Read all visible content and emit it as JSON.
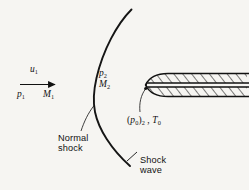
{
  "figure": {
    "background_color": "#f6f5f2",
    "ink_color": "#111111"
  },
  "labels": {
    "upstream_velocity": "u",
    "upstream_velocity_sub": "1",
    "upstream_pressure": "p",
    "upstream_pressure_sub": "1",
    "upstream_mach": "M",
    "upstream_mach_sub": "1",
    "downstream_pressure": "p",
    "downstream_pressure_sub": "2",
    "downstream_mach": "M",
    "downstream_mach_sub": "2",
    "stagnation_open": "(",
    "stagnation_p": "p",
    "stagnation_p_sub": "0",
    "stagnation_close": ")",
    "stagnation_close_sub": "2",
    "stagnation_comma": " , ",
    "stagnation_T": "T",
    "stagnation_T_sub": "0",
    "normal_shock_line1": "Normal",
    "normal_shock_line2": "shock",
    "shock_wave_line1": "Shock",
    "shock_wave_line2": "wave"
  },
  "elements": {
    "flow_arrow": "flow-direction-arrow",
    "bow_shock_curve": "curved-shock-wave-line",
    "pitot_tube": "hatched-pitot-tube-body",
    "leader_normal_shock": "leader-line-to-shock",
    "leader_stagnation": "leader-line-to-tube-tip",
    "leader_shock_wave": "leader-line-to-shock-wave"
  }
}
